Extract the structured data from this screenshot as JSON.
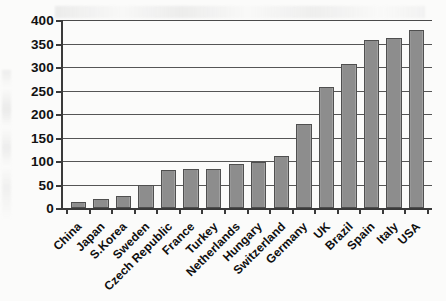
{
  "chart_data": {
    "type": "bar",
    "title": "",
    "xlabel": "",
    "ylabel": "",
    "ylim": [
      0,
      400
    ],
    "ytick_step": 50,
    "yticks": [
      "400",
      "350",
      "300",
      "250",
      "200",
      "150",
      "100",
      "50",
      "0"
    ],
    "grid": true,
    "legend": false,
    "orientation": "vertical",
    "bar_color": "#8d8d8d",
    "bar_edge_color": "#4f4f4f",
    "axis_color": "#3a3a3a",
    "background_color": "#fbfbfa",
    "categories": [
      "China",
      "Japan",
      "S.Korea",
      "Sweden",
      "Czech Republic",
      "France",
      "Turkey",
      "Netherlands",
      "Hungary",
      "Switzerland",
      "Germany",
      "UK",
      "Brazil",
      "Spain",
      "Italy",
      "USA"
    ],
    "values": [
      12,
      20,
      25,
      50,
      80,
      82,
      84,
      93,
      97,
      110,
      178,
      257,
      307,
      358,
      362,
      378
    ]
  }
}
